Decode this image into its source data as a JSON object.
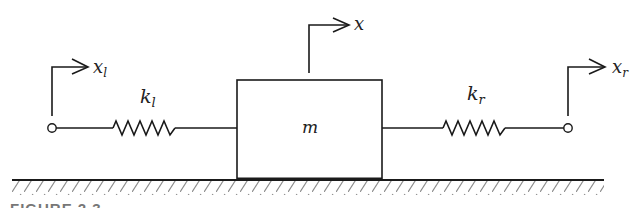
{
  "diagram": {
    "type": "mass-spring system",
    "mass_label": "m",
    "left_spring_label": "k",
    "left_spring_subscript": "l",
    "right_spring_label": "k",
    "right_spring_subscript": "r",
    "left_displacement_label": "x",
    "left_displacement_subscript": "l",
    "mass_displacement_label": "x",
    "right_displacement_label": "x",
    "right_displacement_subscript": "r",
    "colors": {
      "line": "#1a1a1a",
      "hatch": "#8a8a8a",
      "background": "#ffffff"
    }
  },
  "caption": {
    "text": "FIGURE 2.3 ..."
  }
}
